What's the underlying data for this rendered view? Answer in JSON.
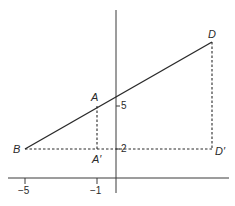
{
  "diagram": {
    "colors": {
      "line": "#2a2a2a",
      "axis": "#3a3a3a",
      "background": "#ffffff"
    },
    "points": {
      "B": {
        "label": "B",
        "x": -5,
        "y": 2
      },
      "A": {
        "label": "A",
        "x": -1,
        "y": 5
      },
      "D": {
        "label": "D"
      },
      "A_prime": {
        "label": "A′",
        "x": -1,
        "y": 2
      },
      "D_prime": {
        "label": "D′",
        "y": 2
      }
    },
    "x_ticks": [
      {
        "value": -5,
        "label": "−5"
      },
      {
        "value": -1,
        "label": "−1"
      }
    ],
    "y_ticks": [
      {
        "value": 5,
        "label": "5"
      },
      {
        "value": 2,
        "label": "2"
      }
    ],
    "segments": [
      {
        "from": "B",
        "to": "D",
        "style": "solid"
      },
      {
        "from": "A",
        "to": "A_prime",
        "style": "dashed"
      },
      {
        "from": "B",
        "to": "D_prime",
        "style": "dashed"
      },
      {
        "from": "D",
        "to": "D_prime",
        "style": "dashed"
      }
    ]
  }
}
